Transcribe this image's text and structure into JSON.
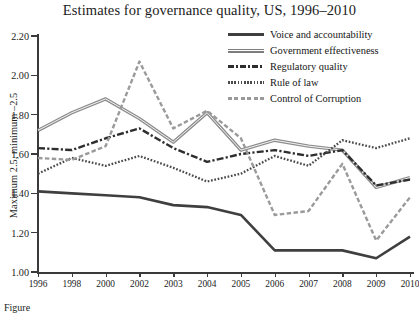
{
  "title": "Estimates for governance quality, US, 1996–2010",
  "caption": "Figure",
  "axes": {
    "ylabel": "Maximum 2.5, minimum –2.5",
    "yticks": [
      "2.20",
      "2.00",
      "1.80",
      "1.60",
      "1.40",
      "1.20",
      "1.00"
    ],
    "xticks": [
      "1996",
      "1998",
      "2000",
      "2002",
      "2003",
      "2004",
      "2005",
      "2006",
      "2007",
      "2008",
      "2009",
      "2010"
    ]
  },
  "legend": [
    {
      "label": "Voice and accountability",
      "style": "solid-thick",
      "color": "#3a3a3a"
    },
    {
      "label": "Government effectiveness",
      "style": "solid-gray-thick",
      "color": "#8a8a8a"
    },
    {
      "label": "Regulatory quality",
      "style": "dash-dot",
      "color": "#2e2e2e"
    },
    {
      "label": "Rule of law",
      "style": "dotted",
      "color": "#4a4a4a"
    },
    {
      "label": "Control of Corruption",
      "style": "dashed",
      "color": "#9a9a9a"
    }
  ],
  "chart_data": {
    "type": "line",
    "title": "Estimates for governance quality, US, 1996–2010",
    "xlabel": "",
    "ylabel": "Maximum 2.5, minimum –2.5",
    "ylim": [
      1.0,
      2.2
    ],
    "grid": false,
    "legend_position": "top-right",
    "categories": [
      "1996",
      "1998",
      "2000",
      "2002",
      "2003",
      "2004",
      "2005",
      "2006",
      "2007",
      "2008",
      "2009",
      "2010"
    ],
    "series": [
      {
        "name": "Voice and accountability",
        "values": [
          1.41,
          1.4,
          1.39,
          1.38,
          1.34,
          1.33,
          1.29,
          1.11,
          1.11,
          1.11,
          1.07,
          1.18
        ]
      },
      {
        "name": "Government effectiveness",
        "values": [
          1.72,
          1.81,
          1.88,
          1.78,
          1.66,
          1.81,
          1.62,
          1.67,
          1.64,
          1.62,
          1.43,
          1.48
        ]
      },
      {
        "name": "Regulatory quality",
        "values": [
          1.63,
          1.62,
          1.68,
          1.73,
          1.63,
          1.56,
          1.6,
          1.62,
          1.59,
          1.62,
          1.44,
          1.47
        ]
      },
      {
        "name": "Rule of law",
        "values": [
          1.5,
          1.58,
          1.54,
          1.59,
          1.53,
          1.46,
          1.5,
          1.59,
          1.54,
          1.67,
          1.63,
          1.68
        ]
      },
      {
        "name": "Control of Corruption",
        "values": [
          1.58,
          1.57,
          1.64,
          2.07,
          1.73,
          1.82,
          1.68,
          1.29,
          1.31,
          1.55,
          1.16,
          1.38
        ]
      }
    ]
  }
}
